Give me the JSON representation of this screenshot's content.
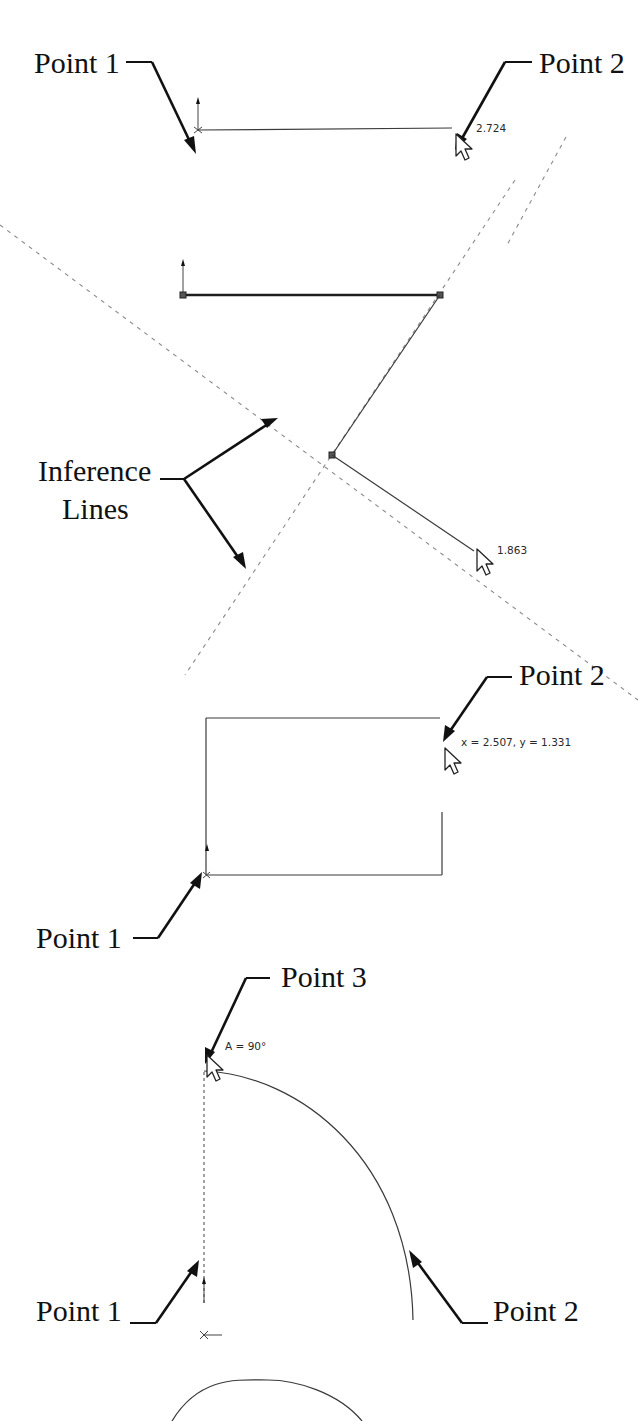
{
  "figure": {
    "panels": [
      {
        "id": "line",
        "callouts": [
          {
            "label": "Point 1"
          },
          {
            "label": "Point 2"
          }
        ],
        "dimension": "2.724"
      },
      {
        "id": "tangent-arc",
        "callouts": [
          {
            "label": "Inference"
          },
          {
            "label": "Lines"
          }
        ],
        "dimension": "1.863"
      },
      {
        "id": "rectangle",
        "callouts": [
          {
            "label": "Point 2"
          },
          {
            "label": "Point 1"
          }
        ],
        "dimension": "x = 2.507, y = 1.331"
      },
      {
        "id": "centerpoint-arc",
        "callouts": [
          {
            "label": "Point 3"
          },
          {
            "label": "Point 1"
          },
          {
            "label": "Point 2"
          }
        ],
        "dimension": "A = 90°"
      },
      {
        "id": "circle",
        "callouts": []
      }
    ],
    "colors": {
      "background": "#ffffff",
      "callout_text": "#111111",
      "sketch_line": "#3a3a3a",
      "inference_line": "#8a8a8a"
    }
  }
}
